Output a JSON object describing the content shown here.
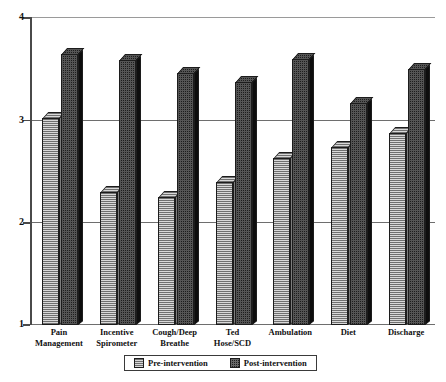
{
  "chart_data": {
    "type": "bar",
    "title": "",
    "xlabel": "",
    "ylabel": "",
    "ylim": [
      1,
      4
    ],
    "yticks": [
      1,
      2,
      3,
      4
    ],
    "ytick_labels": [
      "1",
      "2",
      "3",
      "4"
    ],
    "grid": true,
    "legend_position": "bottom",
    "categories": [
      "Pain Management",
      "Incentive Spirometer",
      "Cough/Deep Breathe",
      "Ted Hose/SCD",
      "Ambulation",
      "Diet",
      "Discharge"
    ],
    "category_lines": [
      [
        "Pain",
        "Management"
      ],
      [
        "Incentive",
        "Spirometer"
      ],
      [
        "Cough/Deep",
        "Breathe"
      ],
      [
        "Ted",
        "Hose/SCD"
      ],
      [
        "Ambulation",
        ""
      ],
      [
        "Diet",
        ""
      ],
      [
        "Discharge",
        ""
      ]
    ],
    "series": [
      {
        "name": "Pre-intervention",
        "color": "#b3b3b3",
        "pattern": "horizontal-hatch",
        "values": [
          3.02,
          2.3,
          2.25,
          2.4,
          2.63,
          2.74,
          2.88
        ]
      },
      {
        "name": "Post-intervention",
        "color": "#1d1d1d",
        "pattern": "checker-dots",
        "values": [
          3.65,
          3.59,
          3.46,
          3.37,
          3.6,
          3.17,
          3.5
        ]
      }
    ]
  },
  "legend": {
    "items": [
      {
        "label": "Pre-intervention",
        "swatch": "pre"
      },
      {
        "label": "Post-intervention",
        "swatch": "post"
      }
    ]
  }
}
